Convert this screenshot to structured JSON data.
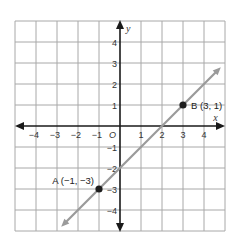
{
  "chart_data": {
    "type": "line",
    "title": "",
    "xlabel": "x",
    "ylabel": "y",
    "xlim": [
      -5,
      5
    ],
    "ylim": [
      -5,
      5
    ],
    "grid": true,
    "x_ticks": [
      -4,
      -3,
      -2,
      -1,
      1,
      2,
      3,
      4
    ],
    "y_ticks": [
      4,
      3,
      2,
      1,
      -1,
      -2,
      -3,
      -4
    ],
    "x_tick_labels": [
      "−4",
      "−3",
      "−2",
      "−1",
      "1",
      "2",
      "3",
      "4"
    ],
    "y_tick_labels": [
      "4",
      "3",
      "2",
      "1",
      "−1",
      "−2",
      "−3",
      "−4"
    ],
    "origin_label": "O",
    "series": [
      {
        "name": "line AB",
        "equation": "y = x − 2",
        "x": [
          -2.8,
          4.8
        ],
        "values": [
          -4.8,
          2.8
        ],
        "arrows": "both",
        "color": "#9a9a9a"
      }
    ],
    "points": [
      {
        "name": "A",
        "x": -1,
        "y": -3,
        "label": "A (−1, −3)"
      },
      {
        "name": "B",
        "x": 3,
        "y": 1,
        "label": "B (3, 1)"
      }
    ],
    "colors": {
      "grid": "#a8a8a8",
      "axes": "#1a1a1a",
      "line": "#9a9a9a",
      "points": "#1e1e1e"
    }
  }
}
